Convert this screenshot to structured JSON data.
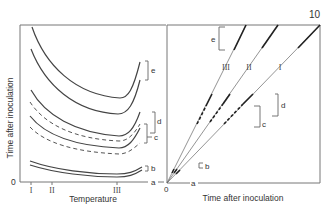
{
  "figure": {
    "page_number": "10",
    "left_panel": {
      "y_axis_label": "Time after inoculation",
      "x_axis_label": "Temperature",
      "origin_label": "0",
      "x_ticks": [
        "I",
        "II",
        "III"
      ],
      "phase_labels": [
        "e",
        "d",
        "c",
        "b",
        "a"
      ]
    },
    "right_panel": {
      "x_axis_label": "Time after inoculation",
      "origin_label": "0",
      "line_labels": [
        "III",
        "II",
        "I"
      ],
      "phase_labels": [
        "e",
        "d",
        "c",
        "b",
        "a"
      ]
    }
  }
}
